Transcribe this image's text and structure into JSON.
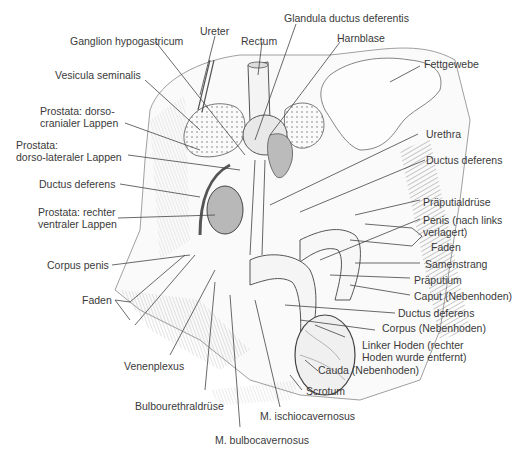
{
  "figure": {
    "type": "anatomical-illustration",
    "labels": {
      "ganglion_hypogastricum": "Ganglion hypogastricum",
      "ureter": "Ureter",
      "rectum": "Rectum",
      "glandula_ductus_deferentis": "Glandula ductus deferentis",
      "harnblase": "Harnblase",
      "fettgewebe": "Fettgewebe",
      "vesicula_seminalis": "Vesicula seminalis",
      "prostata_dorsocranial_1": "Prostata: dorso-",
      "prostata_dorsocranial_2": "cranialer Lappen",
      "prostata_dorsolateral_1": "Prostata:",
      "prostata_dorsolateral_2": "dorso-lateraler Lappen",
      "ductus_deferens_left": "Ductus deferens",
      "prostata_ventral_1": "Prostata: rechter",
      "prostata_ventral_2": "ventraler Lappen",
      "corpus_penis": "Corpus penis",
      "faden_left": "Faden",
      "venenplexus": "Venenplexus",
      "bulbourethraldruese": "Bulbourethraldrüse",
      "m_bulbocavernosus": "M. bulbocavernosus",
      "m_ischiocavernosus": "M. ischiocavernosus",
      "scrotum": "Scrotum",
      "cauda": "Cauda (Nebenhoden)",
      "linker_hoden_1": "Linker Hoden (rechter",
      "linker_hoden_2": "Hoden wurde entfernt)",
      "corpus_nebenhoden": "Corpus (Nebenhoden)",
      "ductus_deferens_right": "Ductus deferens",
      "caput": "Caput (Nebenhoden)",
      "praeputium": "Präputium",
      "samenstrang": "Samenstrang",
      "faden_right": "Faden",
      "penis_1": "Penis (nach links",
      "penis_2": "verlagert)",
      "praeputialdruese": "Präputialdrüse",
      "urethra": "Urethra"
    }
  }
}
